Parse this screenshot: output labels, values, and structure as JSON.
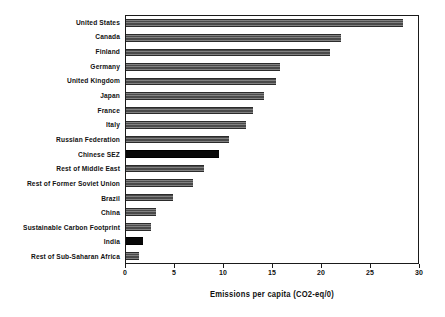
{
  "chart_data": {
    "type": "bar",
    "orientation": "horizontal",
    "title": "",
    "subtitle": "",
    "xlabel": "Emissions per capita (CO2-eq/0)",
    "ylabel": "",
    "xlim": [
      0,
      30
    ],
    "xticks": [
      0,
      5,
      10,
      15,
      20,
      25,
      30
    ],
    "xtick_labels": [
      "0",
      "5",
      "10",
      "15",
      "20",
      "25",
      "30"
    ],
    "grid": false,
    "legend": false,
    "legend_position": "none",
    "frame": true,
    "categories": [
      "United States",
      "Canada",
      "Finland",
      "Germany",
      "United Kingdom",
      "Japan",
      "France",
      "Italy",
      "Russian Federation",
      "Chinese SEZ",
      "Rest of Middle East",
      "Rest of Former Soviet Union",
      "Brazil",
      "China",
      "Sustainable Carbon Footprint",
      "India",
      "Rest of Sub-Saharan Africa"
    ],
    "values": [
      28.3,
      21.9,
      20.8,
      15.7,
      15.3,
      14.1,
      13.0,
      12.2,
      10.5,
      9.5,
      8.0,
      6.8,
      4.8,
      3.1,
      2.6,
      1.7,
      1.3
    ],
    "highlighted": [
      "Chinese SEZ",
      "India"
    ],
    "bars": [
      {
        "label": "United States",
        "value": 28.3,
        "style": "hatched"
      },
      {
        "label": "Canada",
        "value": 21.9,
        "style": "hatched"
      },
      {
        "label": "Finland",
        "value": 20.8,
        "style": "hatched"
      },
      {
        "label": "Germany",
        "value": 15.7,
        "style": "hatched"
      },
      {
        "label": "United Kingdom",
        "value": 15.3,
        "style": "hatched"
      },
      {
        "label": "Japan",
        "value": 14.1,
        "style": "hatched"
      },
      {
        "label": "France",
        "value": 13.0,
        "style": "hatched"
      },
      {
        "label": "Italy",
        "value": 12.2,
        "style": "hatched"
      },
      {
        "label": "Russian Federation",
        "value": 10.5,
        "style": "hatched"
      },
      {
        "label": "Chinese SEZ",
        "value": 9.5,
        "style": "solid-black"
      },
      {
        "label": "Rest of Middle East",
        "value": 8.0,
        "style": "hatched"
      },
      {
        "label": "Rest of Former Soviet Union",
        "value": 6.8,
        "style": "hatched"
      },
      {
        "label": "Brazil",
        "value": 4.8,
        "style": "hatched"
      },
      {
        "label": "China",
        "value": 3.1,
        "style": "hatched"
      },
      {
        "label": "Sustainable Carbon Footprint",
        "value": 2.6,
        "style": "hatched"
      },
      {
        "label": "India",
        "value": 1.7,
        "style": "solid-black"
      },
      {
        "label": "Rest of Sub-Saharan Africa",
        "value": 1.3,
        "style": "hatched"
      }
    ],
    "colors": {
      "bar": "#4a4a4a",
      "bar_highlight": "#080808",
      "axis": "#1a1a1a",
      "text": "#111111",
      "background": "#ffffff"
    }
  }
}
